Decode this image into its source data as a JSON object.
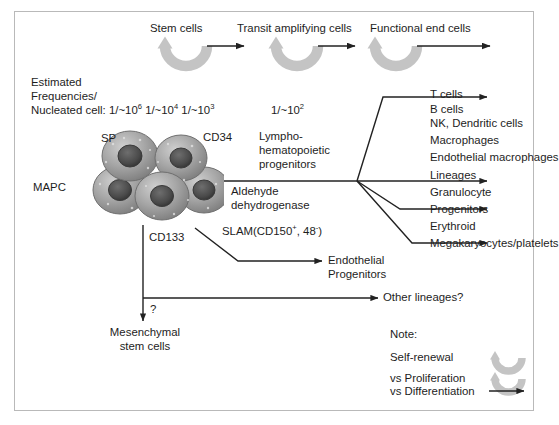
{
  "figure": {
    "title_row": {
      "stem_cells": "Stem cells",
      "transit": "Transit amplifying cells",
      "functional": "Functional end cells"
    },
    "frequencies": {
      "line1": "Estimated",
      "line2": "Frequencies/",
      "line3_prefix": "Nucleated cell: ",
      "f1_base": "1/~10",
      "f1_exp": "6",
      "f2_base": "1/~10",
      "f2_exp": "4",
      "f3_base": "1/~10",
      "f3_exp": "3",
      "f4_base": "1/~10",
      "f4_exp": "2"
    },
    "cell_markers": {
      "sp": "SP",
      "cd34": "CD34",
      "mapc": "MAPC",
      "cd133": "CD133"
    },
    "pathway_labels": {
      "lympho": "Lympho-\nhematopoietic\nprogenitors",
      "aldehyde": "Aldehyde\ndehydrogenase",
      "slam_prefix": "SLAM(CD150",
      "slam_sup1": "+",
      "slam_mid": ", 48",
      "slam_sup2": "-",
      "slam_suffix": ")",
      "endothelial": "Endothelial\nProgenitors",
      "question": "?",
      "mesenchymal": "Mesenchymal\nstem cells",
      "other_lineages": "Other lineages?"
    },
    "outputs": [
      "T cells",
      "B cells",
      "NK, Dendritic cells",
      "Macrophages",
      "Endothelial macrophages",
      "Lineages",
      "Granulocyte",
      "Progenitors",
      "Erythroid",
      "Megakaryocytes/platelets"
    ],
    "note": {
      "heading": "Note:",
      "item1": "Self-renewal",
      "item2": "vs Proliferation",
      "item3": "vs Differentiation"
    },
    "colors": {
      "frame": "#b9b9b9",
      "text": "#1d1d1d",
      "line": "#222222",
      "curved_arrow": "#c4c4c4",
      "cell_fill": "#9a9a9a",
      "nucleus": "#4a4a4a"
    }
  }
}
